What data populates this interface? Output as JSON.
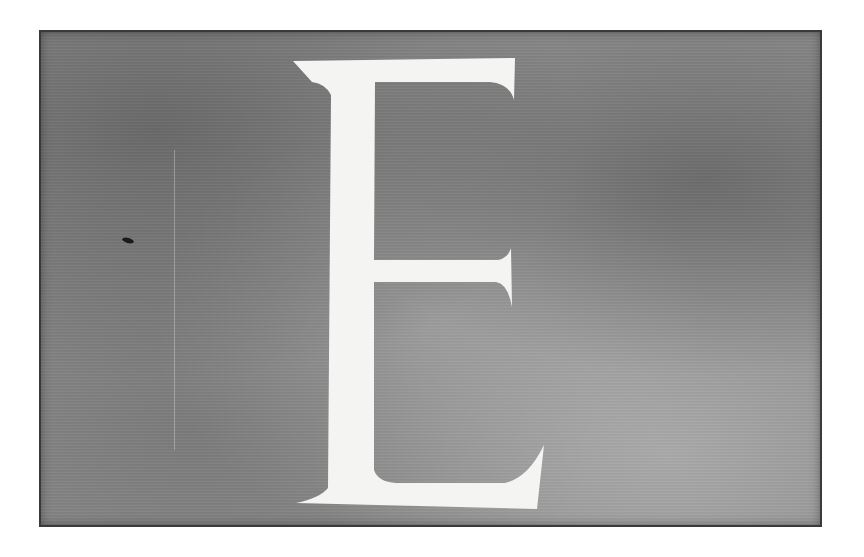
{
  "plate": {
    "letter": "E",
    "background_color": "#8c8c8c",
    "letter_color": "#f4f4f2"
  }
}
